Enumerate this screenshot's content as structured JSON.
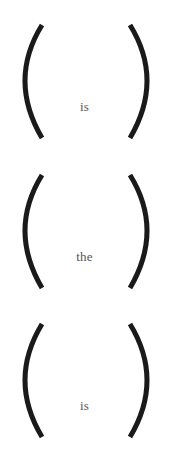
{
  "cells": [
    {
      "word": "is"
    },
    {
      "word": "the"
    },
    {
      "word": "is"
    }
  ],
  "colors": {
    "paren": "#1a1a1a",
    "text": "#555555",
    "background": "#ffffff"
  }
}
